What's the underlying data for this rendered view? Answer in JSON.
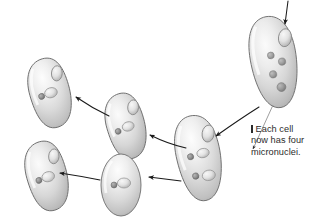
{
  "figure": {
    "title": "Each cell now has four micronuclei",
    "background_color": "#ffffff"
  },
  "annotation": {
    "marker_icon": "vertical-bar-icon",
    "line1": "Each cell",
    "line2": "now has four",
    "line3": "micronuclei.",
    "text_color": "#2b2b2b"
  },
  "palette": {
    "cell_body_light": "#f4f4f4",
    "cell_body_mid": "#d8d8d8",
    "cell_body_dark": "#a8a8a8",
    "cell_outline": "#6e6e6e",
    "macronucleus_fill": "#e8e8e8",
    "macronucleus_edge": "#8a8a8a",
    "micronucleus_fill": "#9a9a9a",
    "micronucleus_edge": "#6a6a6a",
    "arrow_color": "#1a1a1a",
    "leader_color": "#8c8c8c"
  },
  "cells": [
    {
      "id": "cell-top-right",
      "name": "cell-with-four-micronuclei",
      "label": "four micronuclei stage",
      "micronuclei_count": 4,
      "macronuclei_count": 1,
      "position": {
        "cx": 274,
        "cy": 62
      },
      "size": {
        "rx": 23,
        "ry": 46
      },
      "rotation": -10
    },
    {
      "id": "cell-mid-right",
      "name": "cell-dividing-pair",
      "label": "paired nuclei stage",
      "micronuclei_count": 2,
      "macronuclei_count": 3,
      "position": {
        "cx": 199,
        "cy": 158
      },
      "size": {
        "rx": 22,
        "ry": 43
      },
      "rotation": -12
    },
    {
      "id": "cell-mid-center",
      "name": "cell-single-pair-upper",
      "label": "single micronucleus stage",
      "micronuclei_count": 1,
      "macronuclei_count": 2,
      "position": {
        "cx": 126,
        "cy": 126
      },
      "size": {
        "rx": 19,
        "ry": 33
      },
      "rotation": -16
    },
    {
      "id": "cell-upper-left",
      "name": "cell-single-pair-upper-left",
      "label": "single micronucleus stage",
      "micronuclei_count": 1,
      "macronuclei_count": 2,
      "position": {
        "cx": 50,
        "cy": 93
      },
      "size": {
        "rx": 20,
        "ry": 35
      },
      "rotation": -16
    },
    {
      "id": "cell-lower-left",
      "name": "cell-single-pair-lower-left",
      "label": "single micronucleus stage",
      "micronuclei_count": 1,
      "macronuclei_count": 2,
      "position": {
        "cx": 47,
        "cy": 176
      },
      "size": {
        "rx": 20,
        "ry": 35
      },
      "rotation": -16
    },
    {
      "id": "cell-bottom-center",
      "name": "cell-single-pair-bottom",
      "label": "single micronucleus stage",
      "micronuclei_count": 1,
      "macronuclei_count": 2,
      "position": {
        "cx": 121,
        "cy": 185
      },
      "size": {
        "rx": 20,
        "ry": 31
      },
      "rotation": 0
    }
  ],
  "arrows": [
    {
      "id": "arrow-into-top",
      "name": "arrow-incoming-top",
      "from": [
        288,
        2
      ],
      "to": [
        285,
        26
      ],
      "direction": "down"
    },
    {
      "id": "arrow-topright-to-midright",
      "name": "arrow-topright-to-midright",
      "from": [
        258,
        108
      ],
      "to": [
        215,
        137
      ],
      "direction": "down-left"
    },
    {
      "id": "arrow-midright-to-midcenter",
      "name": "arrow-midright-to-midcenter",
      "from": [
        185,
        147
      ],
      "to": [
        148,
        134
      ],
      "direction": "left"
    },
    {
      "id": "arrow-midcenter-to-upperleft",
      "name": "arrow-midcenter-to-upperleft",
      "from": [
        108,
        115
      ],
      "to": [
        74,
        96
      ],
      "direction": "up-left"
    },
    {
      "id": "arrow-midright-to-bottomcenter",
      "name": "arrow-midright-to-bottomcenter",
      "from": [
        180,
        180
      ],
      "to": [
        147,
        176
      ],
      "direction": "left"
    },
    {
      "id": "arrow-bottomcenter-to-lowerleft",
      "name": "arrow-bottomcenter-to-lowerleft",
      "from": [
        99,
        179
      ],
      "to": [
        58,
        172
      ],
      "direction": "left"
    }
  ],
  "leader_line": {
    "name": "annotation-leader-line",
    "from": [
      252,
      150
    ],
    "to": [
      272,
      106
    ],
    "has_arrowhead": true
  }
}
